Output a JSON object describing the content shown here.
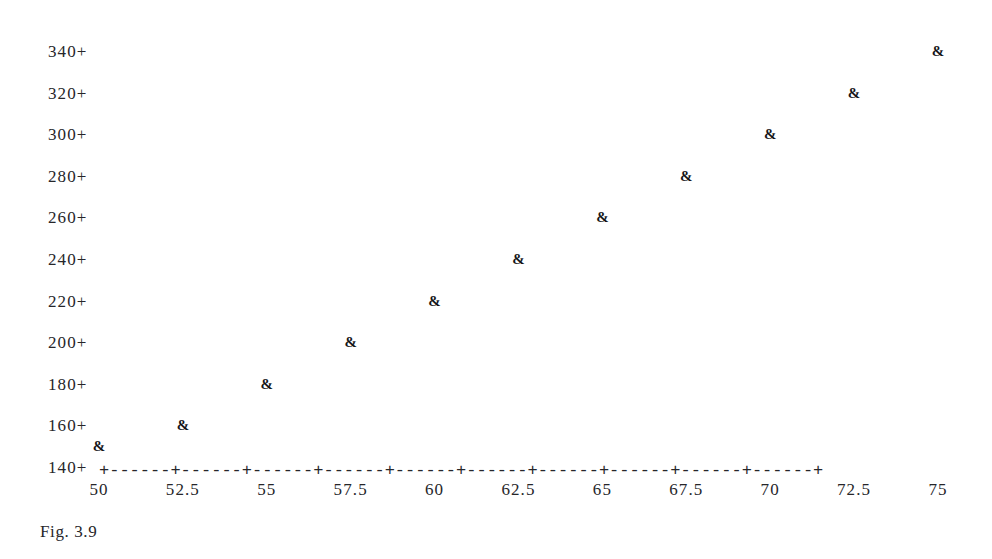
{
  "caption": "Fig. 3.9",
  "marker_glyph": "&",
  "axis_colors": {
    "ink": "#26262a",
    "marker": "#151518",
    "background": "#ffffff"
  },
  "axis": {
    "x_rule": "+------+------+------+------+------+------+------+------+------+------+",
    "y_tick_suffix": "+"
  },
  "chart_data": {
    "type": "scatter",
    "title": "",
    "subtitle": "",
    "xlabel": "",
    "ylabel": "",
    "grid": false,
    "legend": "none",
    "marker": "&",
    "xlim": [
      50,
      75
    ],
    "ylim": [
      140,
      340
    ],
    "xticks": [
      50,
      52.5,
      55,
      57.5,
      60,
      62.5,
      65,
      67.5,
      70,
      72.5,
      75
    ],
    "xtick_labels": [
      "50",
      "52.5",
      "55",
      "57.5",
      "60",
      "62.5",
      "65",
      "67.5",
      "70",
      "72.5",
      "75"
    ],
    "yticks": [
      140,
      160,
      180,
      200,
      220,
      240,
      260,
      280,
      300,
      320,
      340
    ],
    "ytick_labels": [
      "140+",
      "160+",
      "180+",
      "200+",
      "220+",
      "240+",
      "260+",
      "280+",
      "300+",
      "320+",
      "340+"
    ],
    "x": [
      50,
      52.5,
      55,
      57.5,
      60,
      62.5,
      65,
      67.5,
      70,
      72.5,
      75
    ],
    "y": [
      150,
      160,
      180,
      200,
      220,
      240,
      260,
      280,
      300,
      320,
      340
    ],
    "points": [
      {
        "x": 50,
        "y": 150
      },
      {
        "x": 52.5,
        "y": 160
      },
      {
        "x": 55,
        "y": 180
      },
      {
        "x": 57.5,
        "y": 200
      },
      {
        "x": 60,
        "y": 220
      },
      {
        "x": 62.5,
        "y": 240
      },
      {
        "x": 65,
        "y": 260
      },
      {
        "x": 67.5,
        "y": 280
      },
      {
        "x": 70,
        "y": 300
      },
      {
        "x": 72.5,
        "y": 320
      },
      {
        "x": 75,
        "y": 340
      }
    ]
  }
}
